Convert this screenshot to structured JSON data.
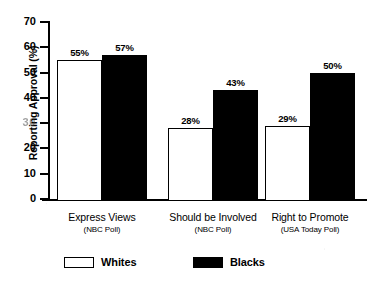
{
  "chart_data": {
    "type": "bar",
    "title": "",
    "xlabel": "",
    "ylabel": "Reporting Approval (%)",
    "ylim": [
      0,
      70
    ],
    "yticks": [
      0,
      10,
      20,
      30,
      40,
      50,
      60,
      70
    ],
    "ytick_labels": [
      "0",
      "10",
      "20",
      "30",
      "40",
      "50",
      "60",
      "70"
    ],
    "grid": false,
    "legend_position": "bottom",
    "categories": [
      "Express Views (NBC Poll)",
      "Should be Involved (NBC Poll)",
      "Right to Promote (USA Today Poll)"
    ],
    "category_lines": [
      {
        "main": "Express Views",
        "sub": "(NBC Poll)"
      },
      {
        "main": "Should be Involved",
        "sub": "(NBC Poll)"
      },
      {
        "main": "Right to Promote",
        "sub": "(USA Today Poll)"
      }
    ],
    "series": [
      {
        "name": "Whites",
        "color": "#ffffff",
        "values": [
          55,
          28,
          29
        ],
        "labels": [
          "55%",
          "28%",
          "29%"
        ]
      },
      {
        "name": "Blacks",
        "color": "#000000",
        "values": [
          57,
          43,
          50
        ],
        "labels": [
          "57%",
          "43%",
          "50%"
        ]
      }
    ]
  },
  "axis": {
    "y_title": "Reporting Approval (%)",
    "ticks": [
      {
        "value": 70,
        "label": "70",
        "faded": false
      },
      {
        "value": 60,
        "label": "60",
        "faded": false
      },
      {
        "value": 50,
        "label": "50",
        "faded": false
      },
      {
        "value": 40,
        "label": "40",
        "faded": false
      },
      {
        "value": 30,
        "label": "30",
        "faded": true
      },
      {
        "value": 20,
        "label": "20",
        "faded": false
      },
      {
        "value": 10,
        "label": "10",
        "faded": false
      },
      {
        "value": 0,
        "label": "0",
        "faded": false
      }
    ]
  },
  "legend": {
    "items": [
      {
        "label": "Whites",
        "style": "hollow"
      },
      {
        "label": "Blacks",
        "style": "filled"
      }
    ]
  },
  "colors": {
    "whites_bar": "#ffffff",
    "blacks_bar": "#000000",
    "axis": "#000000",
    "background": "#ffffff"
  }
}
